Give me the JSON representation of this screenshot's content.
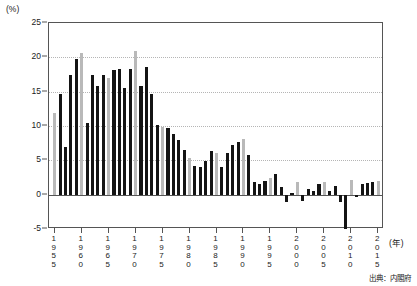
{
  "chart_data": {
    "type": "bar",
    "title": "",
    "subtitle": "",
    "xlabel": "(年)",
    "ylabel": "(%)",
    "unit_label": "(%)",
    "year_unit_label": "(年)",
    "source_note": "出典：内閣府",
    "ylim": [
      -5,
      25
    ],
    "ytick_values": [
      25,
      20,
      15,
      10,
      5,
      0,
      -5
    ],
    "ytick_labels": [
      "25",
      "20",
      "15",
      "10",
      "5",
      "0",
      "-5"
    ],
    "gridlines": true,
    "legend": "none",
    "xlim": [
      1955,
      2015
    ],
    "xtick_years": [
      1955,
      1960,
      1965,
      1970,
      1975,
      1980,
      1985,
      1990,
      1995,
      2000,
      2005,
      2010,
      2015
    ],
    "xtick_labels": [
      "1955",
      "1960",
      "1965",
      "1970",
      "1975",
      "1980",
      "1985",
      "1990",
      "1995",
      "2000",
      "2005",
      "2010",
      "2015"
    ],
    "series_name": "実質経済成長率",
    "colors": {
      "primary_bar": "#141414",
      "highlight_bar": "#b9b9b9",
      "axis": "#555555",
      "grid": "#b5b5b5",
      "background": "#ffffff"
    },
    "categories": [
      1955,
      1956,
      1957,
      1958,
      1959,
      1960,
      1961,
      1962,
      1963,
      1964,
      1965,
      1966,
      1967,
      1968,
      1969,
      1970,
      1971,
      1972,
      1973,
      1974,
      1975,
      1976,
      1977,
      1978,
      1979,
      1980,
      1981,
      1982,
      1983,
      1984,
      1985,
      1986,
      1987,
      1988,
      1989,
      1990,
      1991,
      1992,
      1993,
      1994,
      1995,
      1996,
      1997,
      1998,
      1999,
      2000,
      2001,
      2002,
      2003,
      2004,
      2005,
      2006,
      2007,
      2008,
      2009,
      2010,
      2011,
      2012,
      2013,
      2014,
      2015
    ],
    "values": [
      11.9,
      14.7,
      6.9,
      17.4,
      19.8,
      20.7,
      10.4,
      17.4,
      15.8,
      17.4,
      17.0,
      18.1,
      18.3,
      15.6,
      18.3,
      20.9,
      15.8,
      18.6,
      14.7,
      10.1,
      9.9,
      9.7,
      8.8,
      7.9,
      6.5,
      5.3,
      4.2,
      4.1,
      4.9,
      6.3,
      6.0,
      4.1,
      6.1,
      7.2,
      7.6,
      8.1,
      5.8,
      1.9,
      1.6,
      2.0,
      2.4,
      3.0,
      1.1,
      -1.1,
      0.2,
      1.8,
      -0.9,
      0.8,
      0.6,
      1.5,
      1.9,
      0.6,
      1.3,
      -1.1,
      -5.0,
      2.1,
      -0.3,
      1.5,
      1.7,
      1.8,
      2.0
    ],
    "bar_shading": [
      "gray",
      "black",
      "black",
      "black",
      "black",
      "gray",
      "black",
      "black",
      "black",
      "black",
      "gray",
      "black",
      "black",
      "black",
      "black",
      "gray",
      "black",
      "black",
      "black",
      "black",
      "gray",
      "black",
      "black",
      "black",
      "black",
      "gray",
      "black",
      "black",
      "black",
      "black",
      "gray",
      "black",
      "black",
      "black",
      "black",
      "gray",
      "black",
      "black",
      "black",
      "black",
      "gray",
      "black",
      "black",
      "black",
      "black",
      "gray",
      "black",
      "black",
      "black",
      "black",
      "gray",
      "black",
      "black",
      "black",
      "black",
      "gray",
      "black",
      "black",
      "black",
      "black",
      "gray"
    ]
  }
}
